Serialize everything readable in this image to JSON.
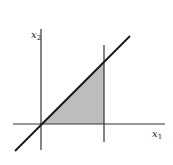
{
  "diagram": {
    "labels": {
      "x_axis": "x",
      "x_axis_sub": "1",
      "y_axis": "x",
      "y_axis_sub": "2"
    },
    "colors": {
      "line": "#1a1a1a",
      "axis": "#333333",
      "shade": "#bdbdbd"
    },
    "elements": [
      {
        "type": "axis",
        "name": "x1-axis",
        "from": [
          13,
          124
        ],
        "to": [
          165,
          124
        ]
      },
      {
        "type": "axis",
        "name": "x2-axis",
        "from": [
          41,
          29
        ],
        "to": [
          41,
          150
        ]
      },
      {
        "type": "line",
        "name": "diagonal-line",
        "from": [
          15,
          152
        ],
        "to": [
          130,
          37
        ]
      },
      {
        "type": "line",
        "name": "vertical-bound-line",
        "from": [
          104,
          45
        ],
        "to": [
          104,
          142
        ]
      },
      {
        "type": "region",
        "name": "shaded-triangle",
        "points": [
          [
            41,
            124
          ],
          [
            104,
            62
          ],
          [
            104,
            124
          ]
        ]
      }
    ]
  }
}
